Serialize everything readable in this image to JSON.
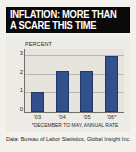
{
  "title": {
    "line1": "INFLATION: MORE THAN",
    "line2": "A SCARE THIS TIME"
  },
  "source": "Data: Bureau of Labor Statistics, Global Insight Inc.",
  "colors": {
    "title_bg": "#0a0a0a",
    "title_text": "#ffffff",
    "bar": "#32508c",
    "plot_bg": "#e6e4dd",
    "page_bg": "#f3f1ec"
  },
  "chart_data": {
    "type": "bar",
    "title": "INFLATION: MORE THAN A SCARE THIS TIME",
    "categories": [
      "'03",
      "'04",
      "'05",
      "'06*"
    ],
    "values": [
      1.1,
      2.2,
      2.2,
      3.0
    ],
    "series": [
      {
        "name": "Core CPI",
        "values": [
          1.1,
          2.2,
          2.2,
          3.0
        ]
      }
    ],
    "xlabel": "",
    "ylabel": "PERCENT",
    "ylim": [
      0,
      3.4
    ],
    "yticks": [
      0,
      1,
      2,
      3
    ],
    "ytick_labels": [
      "0",
      "1",
      "2",
      "3"
    ],
    "grid": true,
    "legend": false,
    "annotations": {
      "series_label_line1": "CORE CPI",
      "series_label_line2": "EXCLUDES ENERGY AND FOOD",
      "footnote": "*DECEMBER TO MAY, ANNUAL RATE"
    }
  }
}
